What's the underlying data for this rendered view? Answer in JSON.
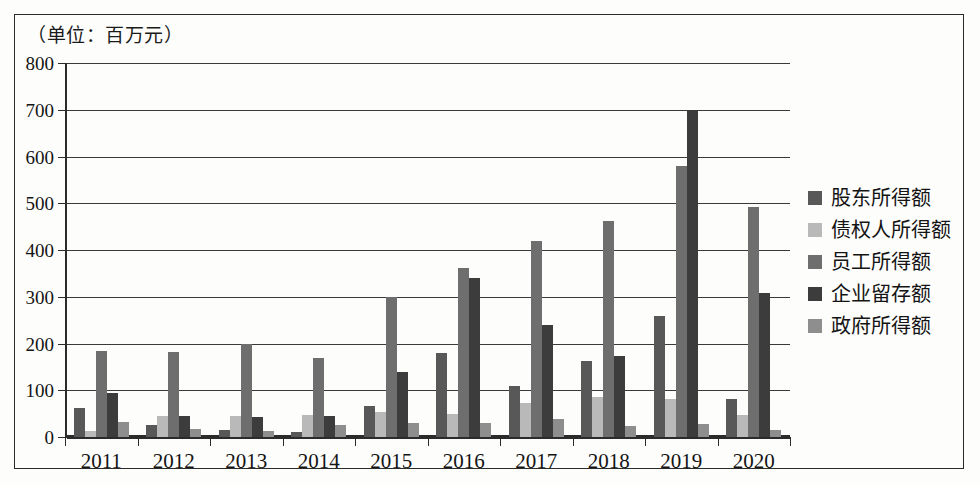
{
  "chart_data": {
    "type": "bar",
    "title": "（单位：百万元）",
    "subtitle": "",
    "xlabel": "",
    "ylabel": "",
    "ylim": [
      0,
      800
    ],
    "ytick_step": 100,
    "yticks": [
      "800",
      "700",
      "600",
      "500",
      "400",
      "300",
      "200",
      "100",
      "0"
    ],
    "grid": true,
    "legend_position": "right",
    "categories": [
      "2011",
      "2012",
      "2013",
      "2014",
      "2015",
      "2016",
      "2017",
      "2018",
      "2019",
      "2020"
    ],
    "series": [
      {
        "name": "股东所得额",
        "color": "#585858",
        "values": [
          62,
          25,
          14,
          11,
          66,
          180,
          110,
          162,
          259,
          81
        ]
      },
      {
        "name": "债权人所得额",
        "color": "#b9b9b9",
        "values": [
          13,
          44,
          44,
          48,
          53,
          50,
          72,
          85,
          81,
          47
        ]
      },
      {
        "name": "员工所得额",
        "color": "#6e6e6e",
        "values": [
          183,
          182,
          199,
          169,
          299,
          361,
          419,
          463,
          580,
          492
        ]
      },
      {
        "name": "企业留存额",
        "color": "#3c3c3c",
        "values": [
          95,
          44,
          42,
          46,
          140,
          341,
          240,
          174,
          698,
          307
        ]
      },
      {
        "name": "政府所得额",
        "color": "#8e8e8e",
        "values": [
          32,
          17,
          12,
          26,
          31,
          31,
          39,
          23,
          28,
          15
        ]
      }
    ]
  },
  "colors": {
    "axis": "#2b2b2b",
    "grid": "#3a3a3a",
    "frame": "#2b2b2b",
    "text": "#141414",
    "background": "#fdfdfc"
  }
}
